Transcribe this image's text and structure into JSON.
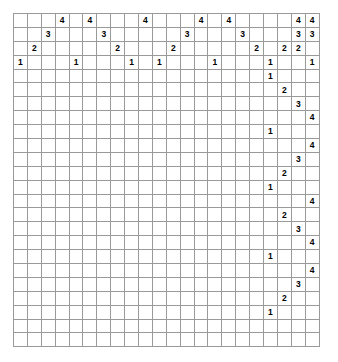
{
  "puzzle": {
    "kind": "nonogram",
    "grid_cols": 18,
    "grid_rows": 20,
    "clue_rows_top": 4,
    "clue_cols_right": 4,
    "colors": {
      "filled": "#000000",
      "empty": "#ffffff",
      "grid_line": "#9a9a9a",
      "heavy_line": "#000000"
    },
    "column_clues": [
      [
        "",
        "",
        "",
        "1"
      ],
      [
        "",
        "",
        "2",
        ""
      ],
      [
        "",
        "3",
        "",
        ""
      ],
      [
        "4",
        "",
        "",
        ""
      ],
      [
        "",
        "",
        "",
        "1"
      ],
      [
        "4",
        "",
        "",
        ""
      ],
      [
        "",
        "3",
        "",
        ""
      ],
      [
        "",
        "",
        "2",
        ""
      ],
      [
        "",
        "",
        "",
        "1"
      ],
      [
        "4",
        "",
        "",
        ""
      ],
      [
        "",
        "",
        "",
        "1"
      ],
      [
        "",
        "",
        "2",
        ""
      ],
      [
        "",
        "3",
        "",
        ""
      ],
      [
        "4",
        "",
        "",
        ""
      ],
      [
        "",
        "",
        "",
        "1"
      ],
      [
        "4",
        "",
        "",
        ""
      ],
      [
        "",
        "3",
        "",
        ""
      ],
      [
        "",
        "",
        "2",
        ""
      ],
      [
        "",
        "",
        "",
        "1"
      ]
    ],
    "row_clues": [
      [
        "",
        "",
        "4",
        "4"
      ],
      [
        "",
        "",
        "3",
        "3"
      ],
      [
        "",
        "2",
        "2",
        ""
      ],
      [
        "1",
        "",
        "",
        "1"
      ],
      [
        "1",
        "",
        "",
        ""
      ],
      [
        "",
        "2",
        "",
        ""
      ],
      [
        "",
        "",
        "3",
        ""
      ],
      [
        "",
        "",
        "",
        "4"
      ],
      [
        "1",
        "",
        "",
        ""
      ],
      [
        "",
        "",
        "",
        "4"
      ],
      [
        "",
        "",
        "3",
        ""
      ],
      [
        "",
        "2",
        "",
        ""
      ],
      [
        "1",
        "",
        "",
        ""
      ],
      [
        "",
        "",
        "",
        "4"
      ],
      [
        "",
        "2",
        "",
        ""
      ],
      [
        "",
        "",
        "3",
        ""
      ],
      [
        "",
        "",
        "",
        "4"
      ],
      [
        "1",
        "",
        "",
        ""
      ],
      [
        "",
        "",
        "",
        "4"
      ],
      [
        "",
        "",
        "3",
        ""
      ],
      [
        "",
        "2",
        "",
        ""
      ],
      [
        "1",
        "",
        "",
        ""
      ]
    ],
    "cells": [
      [
        0,
        0,
        1,
        1,
        0,
        1,
        1,
        1,
        0,
        0,
        1,
        1,
        1,
        0,
        1,
        1,
        0,
        0
      ],
      [
        1,
        0,
        0,
        1,
        1,
        0,
        0,
        1,
        1,
        0,
        0,
        1,
        1,
        0,
        0,
        1,
        1,
        0
      ],
      [
        1,
        1,
        0,
        0,
        1,
        1,
        0,
        0,
        1,
        1,
        0,
        0,
        1,
        1,
        0,
        0,
        1,
        1
      ],
      [
        0,
        1,
        1,
        0,
        0,
        1,
        1,
        0,
        0,
        1,
        1,
        0,
        0,
        1,
        1,
        0,
        0,
        1
      ],
      [
        0,
        0,
        1,
        1,
        0,
        0,
        1,
        1,
        1,
        1,
        1,
        1,
        0,
        0,
        1,
        1,
        0,
        0
      ],
      [
        0,
        0,
        0,
        1,
        1,
        0,
        1,
        1,
        0,
        1,
        1,
        1,
        1,
        0,
        0,
        1,
        0,
        0
      ],
      [
        0,
        0,
        1,
        1,
        0,
        0,
        1,
        1,
        1,
        1,
        1,
        1,
        0,
        0,
        1,
        1,
        0,
        0
      ],
      [
        0,
        1,
        1,
        0,
        0,
        1,
        1,
        0,
        0,
        1,
        1,
        0,
        0,
        1,
        1,
        0,
        0,
        1
      ],
      [
        1,
        1,
        0,
        0,
        1,
        1,
        0,
        0,
        1,
        1,
        0,
        0,
        1,
        1,
        0,
        0,
        1,
        1
      ],
      [
        1,
        0,
        0,
        1,
        1,
        0,
        0,
        1,
        1,
        0,
        0,
        1,
        1,
        0,
        0,
        1,
        1,
        0
      ],
      [
        0,
        0,
        1,
        1,
        0,
        1,
        1,
        1,
        0,
        0,
        1,
        1,
        1,
        0,
        1,
        1,
        0,
        0
      ],
      [
        1,
        0,
        0,
        1,
        1,
        0,
        0,
        1,
        1,
        0,
        0,
        1,
        1,
        0,
        0,
        1,
        1,
        0
      ],
      [
        1,
        1,
        0,
        0,
        1,
        1,
        0,
        0,
        1,
        1,
        0,
        0,
        1,
        1,
        0,
        0,
        1,
        1
      ],
      [
        0,
        1,
        1,
        0,
        0,
        1,
        1,
        0,
        0,
        1,
        1,
        0,
        0,
        1,
        1,
        0,
        0,
        1
      ],
      [
        0,
        0,
        1,
        1,
        0,
        0,
        1,
        1,
        1,
        1,
        1,
        1,
        0,
        0,
        1,
        1,
        0,
        0
      ],
      [
        0,
        0,
        0,
        1,
        1,
        0,
        1,
        1,
        0,
        1,
        1,
        1,
        1,
        0,
        0,
        1,
        0,
        0
      ],
      [
        0,
        0,
        1,
        1,
        0,
        0,
        1,
        1,
        1,
        1,
        1,
        1,
        0,
        0,
        1,
        1,
        0,
        0
      ],
      [
        0,
        1,
        1,
        0,
        0,
        1,
        1,
        0,
        0,
        1,
        1,
        0,
        0,
        1,
        1,
        0,
        0,
        1
      ],
      [
        1,
        1,
        0,
        0,
        1,
        1,
        0,
        0,
        1,
        1,
        0,
        0,
        1,
        1,
        0,
        0,
        1,
        1
      ],
      [
        1,
        0,
        0,
        1,
        1,
        0,
        0,
        1,
        1,
        0,
        0,
        1,
        1,
        0,
        0,
        1,
        1,
        0
      ]
    ]
  }
}
